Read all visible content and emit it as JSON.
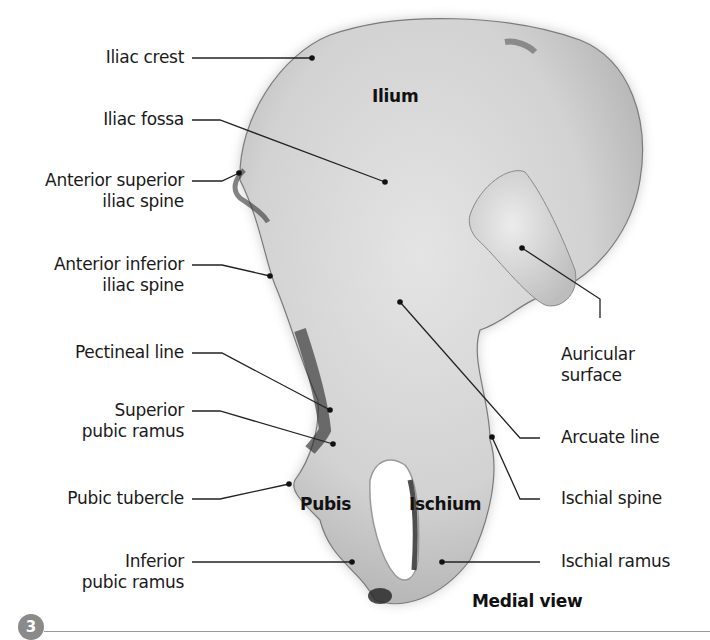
{
  "figure": {
    "view_caption": "Medial view",
    "figure_number": "3",
    "regions": [
      {
        "id": "ilium",
        "label": "Ilium"
      },
      {
        "id": "pubis",
        "label": "Pubis"
      },
      {
        "id": "ischium",
        "label": "Ischium"
      }
    ],
    "labels_left": [
      {
        "id": "iliac-crest",
        "lines": [
          "Iliac crest"
        ]
      },
      {
        "id": "iliac-fossa",
        "lines": [
          "Iliac fossa"
        ]
      },
      {
        "id": "asis",
        "lines": [
          "Anterior superior",
          "iliac spine"
        ]
      },
      {
        "id": "aiis",
        "lines": [
          "Anterior inferior",
          "iliac spine"
        ]
      },
      {
        "id": "pectineal-line",
        "lines": [
          "Pectineal line"
        ]
      },
      {
        "id": "superior-pubic-ramus",
        "lines": [
          "Superior",
          "pubic ramus"
        ]
      },
      {
        "id": "pubic-tubercle",
        "lines": [
          "Pubic tubercle"
        ]
      },
      {
        "id": "inferior-pubic-ramus",
        "lines": [
          "Inferior",
          "pubic ramus"
        ]
      }
    ],
    "labels_right": [
      {
        "id": "auricular-surface",
        "lines": [
          "Auricular",
          "surface"
        ]
      },
      {
        "id": "arcuate-line",
        "lines": [
          "Arcuate line"
        ]
      },
      {
        "id": "ischial-spine",
        "lines": [
          "Ischial spine"
        ]
      },
      {
        "id": "ischial-ramus",
        "lines": [
          "Ischial ramus"
        ]
      }
    ]
  }
}
